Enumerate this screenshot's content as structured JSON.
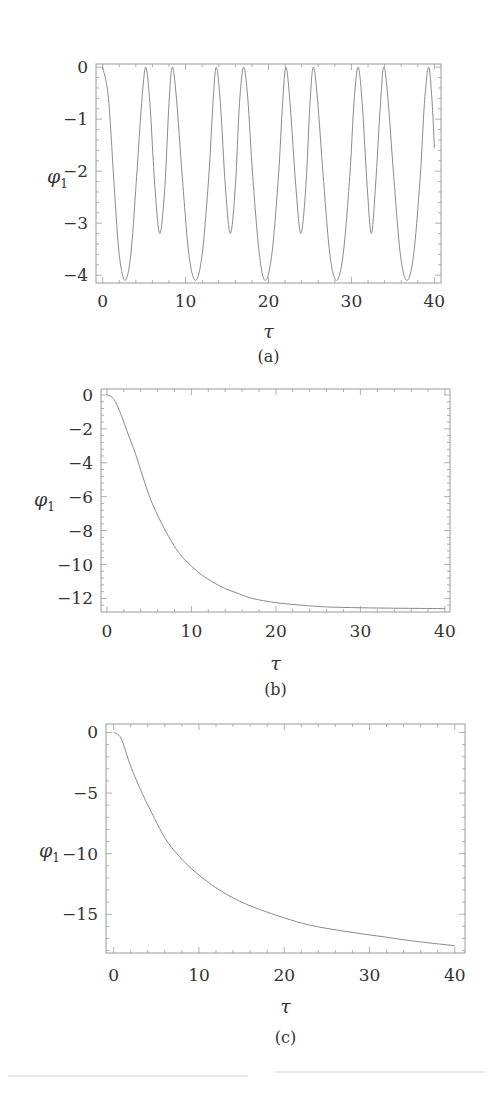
{
  "figure": {
    "panels": [
      {
        "id": "a",
        "caption": "(a)",
        "xlabel": "τ",
        "ylabel": "φ",
        "ylabel_sub": "1"
      },
      {
        "id": "b",
        "caption": "(b)",
        "xlabel": "τ",
        "ylabel": "φ",
        "ylabel_sub": "1"
      },
      {
        "id": "c",
        "caption": "(c)",
        "xlabel": "τ",
        "ylabel": "φ",
        "ylabel_sub": "1"
      }
    ]
  },
  "chart_data": [
    {
      "type": "line",
      "title": "",
      "caption": "(a)",
      "xlabel": "τ",
      "ylabel": "φ1",
      "xlim": [
        -0.8,
        40.8
      ],
      "ylim": [
        -4.15,
        0.06
      ],
      "xticks": [
        0,
        10,
        20,
        30,
        40
      ],
      "yticks": [
        0,
        -1,
        -2,
        -3,
        -4
      ],
      "grid": false,
      "legend": null,
      "series": [
        {
          "name": "φ1",
          "x": [
            0,
            0.7,
            1.4,
            2.0,
            2.7,
            3.4,
            4.1,
            4.7,
            5.2,
            5.7,
            6.3,
            6.9,
            7.5,
            8.0,
            8.4,
            8.9,
            9.6,
            10.4,
            11.2,
            12.0,
            12.8,
            13.3,
            13.7,
            14.2,
            14.8,
            15.4,
            16.0,
            16.5,
            17.0,
            17.5,
            18.1,
            18.9,
            19.6,
            20.4,
            21.2,
            21.7,
            22.1,
            22.6,
            23.3,
            23.9,
            24.5,
            25.0,
            25.4,
            25.9,
            26.6,
            27.4,
            28.2,
            29.0,
            29.8,
            30.3,
            30.8,
            31.3,
            31.9,
            32.4,
            32.9,
            33.5,
            33.9,
            34.4,
            35.1,
            35.9,
            36.7,
            37.5,
            38.3,
            38.8,
            39.3,
            39.7,
            40.0
          ],
          "y": [
            0,
            -0.6,
            -2.3,
            -3.6,
            -4.1,
            -3.6,
            -2.1,
            -0.7,
            0,
            -0.7,
            -2.3,
            -3.2,
            -2.3,
            -0.7,
            0,
            -0.6,
            -2.1,
            -3.6,
            -4.1,
            -3.6,
            -2.1,
            -0.7,
            0,
            -0.7,
            -2.3,
            -3.2,
            -2.3,
            -0.7,
            0,
            -0.6,
            -2.1,
            -3.6,
            -4.1,
            -3.6,
            -2.1,
            -0.7,
            0,
            -0.7,
            -2.3,
            -3.2,
            -2.3,
            -0.7,
            0,
            -0.6,
            -2.1,
            -3.6,
            -4.1,
            -3.6,
            -2.1,
            -0.7,
            0,
            -0.7,
            -2.3,
            -3.2,
            -2.3,
            -0.7,
            0,
            -0.6,
            -2.1,
            -3.6,
            -4.1,
            -3.6,
            -2.1,
            -0.7,
            0,
            -0.6,
            -1.55
          ]
        }
      ]
    },
    {
      "type": "line",
      "title": "",
      "caption": "(b)",
      "xlabel": "τ",
      "ylabel": "φ1",
      "xlim": [
        -0.7,
        40.6
      ],
      "ylim": [
        -12.8,
        0.35
      ],
      "xticks": [
        0,
        10,
        20,
        30,
        40
      ],
      "yticks": [
        0,
        -2,
        -4,
        -6,
        -8,
        -10,
        -12
      ],
      "grid": false,
      "legend": null,
      "series": [
        {
          "name": "φ1",
          "x": [
            0,
            0.5,
            1.0,
            1.7,
            2.5,
            3.4,
            4.3,
            5.2,
            6.4,
            7.6,
            9.0,
            11.2,
            13.5,
            15.5,
            17.2,
            20.0,
            23.0,
            26.0,
            30.0,
            35.0,
            40.0
          ],
          "y": [
            0,
            -0.1,
            -0.4,
            -1.2,
            -2.3,
            -3.5,
            -4.9,
            -6.2,
            -7.5,
            -8.6,
            -9.6,
            -10.6,
            -11.3,
            -11.7,
            -12.0,
            -12.25,
            -12.4,
            -12.5,
            -12.55,
            -12.58,
            -12.6
          ]
        }
      ]
    },
    {
      "type": "line",
      "title": "",
      "caption": "(c)",
      "xlabel": "τ",
      "ylabel": "φ1",
      "xlim": [
        -0.9,
        41.2
      ],
      "ylim": [
        -18.2,
        0.7
      ],
      "xticks": [
        0,
        10,
        20,
        30,
        40
      ],
      "yticks": [
        0,
        -5,
        -10,
        -15
      ],
      "grid": false,
      "legend": null,
      "series": [
        {
          "name": "φ1",
          "x": [
            0,
            0.5,
            1.0,
            1.9,
            2.7,
            3.6,
            4.8,
            6.0,
            7.4,
            8.9,
            10.6,
            12.4,
            14.7,
            17.1,
            20.0,
            23.0,
            27.0,
            31.0,
            35.0,
            40.0
          ],
          "y": [
            0,
            -0.15,
            -0.7,
            -2.6,
            -4.0,
            -5.4,
            -7.1,
            -8.7,
            -10.0,
            -11.1,
            -12.1,
            -13.0,
            -13.9,
            -14.6,
            -15.3,
            -15.9,
            -16.4,
            -16.8,
            -17.2,
            -17.6
          ]
        }
      ]
    }
  ],
  "layout": {
    "line_color": "#8a8a8a",
    "frame_color": "#9a9a9a",
    "text_color": "#333333"
  }
}
